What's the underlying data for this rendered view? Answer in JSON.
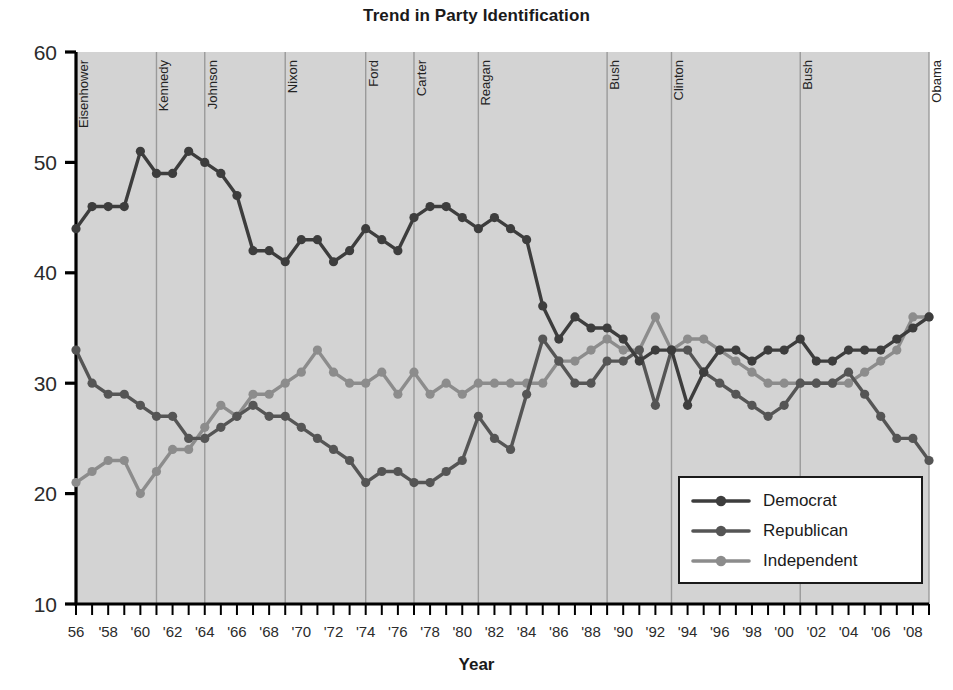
{
  "chart_data": {
    "type": "line",
    "title": "Trend in Party Identification",
    "xlabel": "Year",
    "ylabel": "",
    "xlim": [
      1956,
      2009
    ],
    "ylim": [
      10,
      60
    ],
    "grid": false,
    "legend_position": "bottom-right",
    "yticks": [
      10,
      20,
      30,
      40,
      50,
      60
    ],
    "ytick_labels": [
      "10",
      "20",
      "30",
      "40",
      "50",
      "60"
    ],
    "x": [
      1956,
      1957,
      1958,
      1959,
      1960,
      1961,
      1962,
      1963,
      1964,
      1965,
      1966,
      1967,
      1968,
      1969,
      1970,
      1971,
      1972,
      1973,
      1974,
      1975,
      1976,
      1977,
      1978,
      1979,
      1980,
      1981,
      1982,
      1983,
      1984,
      1985,
      1986,
      1987,
      1988,
      1989,
      1990,
      1991,
      1992,
      1993,
      1994,
      1995,
      1996,
      1997,
      1998,
      1999,
      2000,
      2001,
      2002,
      2003,
      2004,
      2005,
      2006,
      2007,
      2008,
      2009
    ],
    "xtick_labels": [
      "56",
      "'58",
      "'60",
      "'62",
      "'64",
      "'66",
      "'68",
      "'70",
      "'72",
      "'74",
      "'76",
      "'78",
      "'80",
      "'82",
      "'84",
      "'86",
      "'88",
      "'90",
      "'92",
      "'94",
      "'96",
      "'98",
      "'00",
      "'02",
      "'04",
      "'06",
      "'08"
    ],
    "xtick_values": [
      1956,
      1958,
      1960,
      1962,
      1964,
      1966,
      1968,
      1970,
      1972,
      1974,
      1976,
      1978,
      1980,
      1982,
      1984,
      1986,
      1988,
      1990,
      1992,
      1994,
      1996,
      1998,
      2000,
      2002,
      2004,
      2006,
      2008
    ],
    "series": [
      {
        "name": "Democrat",
        "color": "#3d3d3d",
        "values": [
          44,
          46,
          46,
          46,
          51,
          49,
          49,
          51,
          50,
          49,
          47,
          42,
          42,
          41,
          43,
          43,
          41,
          42,
          44,
          43,
          42,
          45,
          46,
          46,
          45,
          44,
          45,
          44,
          43,
          37,
          34,
          36,
          35,
          35,
          34,
          32,
          33,
          33,
          28,
          31,
          33,
          33,
          32,
          33,
          33,
          34,
          32,
          32,
          33,
          33,
          33,
          34,
          35,
          36
        ]
      },
      {
        "name": "Republican",
        "color": "#555555",
        "values": [
          33,
          30,
          29,
          29,
          28,
          27,
          27,
          25,
          25,
          26,
          27,
          28,
          27,
          27,
          26,
          25,
          24,
          23,
          21,
          22,
          22,
          21,
          21,
          22,
          23,
          27,
          25,
          24,
          29,
          34,
          32,
          30,
          30,
          32,
          32,
          33,
          28,
          33,
          33,
          31,
          30,
          29,
          28,
          27,
          28,
          30,
          30,
          30,
          31,
          29,
          27,
          25,
          25,
          23
        ]
      },
      {
        "name": "Independent",
        "color": "#8c8c8c",
        "values": [
          21,
          22,
          23,
          23,
          20,
          22,
          24,
          24,
          26,
          28,
          27,
          29,
          29,
          30,
          31,
          33,
          31,
          30,
          30,
          31,
          29,
          31,
          29,
          30,
          29,
          30,
          30,
          30,
          30,
          30,
          32,
          32,
          33,
          34,
          33,
          33,
          36,
          33,
          34,
          34,
          33,
          32,
          31,
          30,
          30,
          30,
          30,
          30,
          30,
          31,
          32,
          33,
          36,
          36
        ]
      }
    ],
    "annotations": [
      {
        "label": "Eisenhower",
        "year": 1956
      },
      {
        "label": "Kennedy",
        "year": 1961
      },
      {
        "label": "Johnson",
        "year": 1964
      },
      {
        "label": "Nixon",
        "year": 1969
      },
      {
        "label": "Ford",
        "year": 1974
      },
      {
        "label": "Carter",
        "year": 1977
      },
      {
        "label": "Reagan",
        "year": 1981
      },
      {
        "label": "Bush",
        "year": 1989
      },
      {
        "label": "Clinton",
        "year": 1993
      },
      {
        "label": "Bush",
        "year": 2001
      },
      {
        "label": "Obama",
        "year": 2009
      }
    ]
  },
  "legend": {
    "entries": [
      {
        "label": "Democrat"
      },
      {
        "label": "Republican"
      },
      {
        "label": "Independent"
      }
    ]
  },
  "colors": {
    "democrat": "#3d3d3d",
    "republican": "#555555",
    "independent": "#8c8c8c",
    "plot_background": "#d3d3d3",
    "axis": "#000000",
    "divider": "#9a9a9a"
  }
}
